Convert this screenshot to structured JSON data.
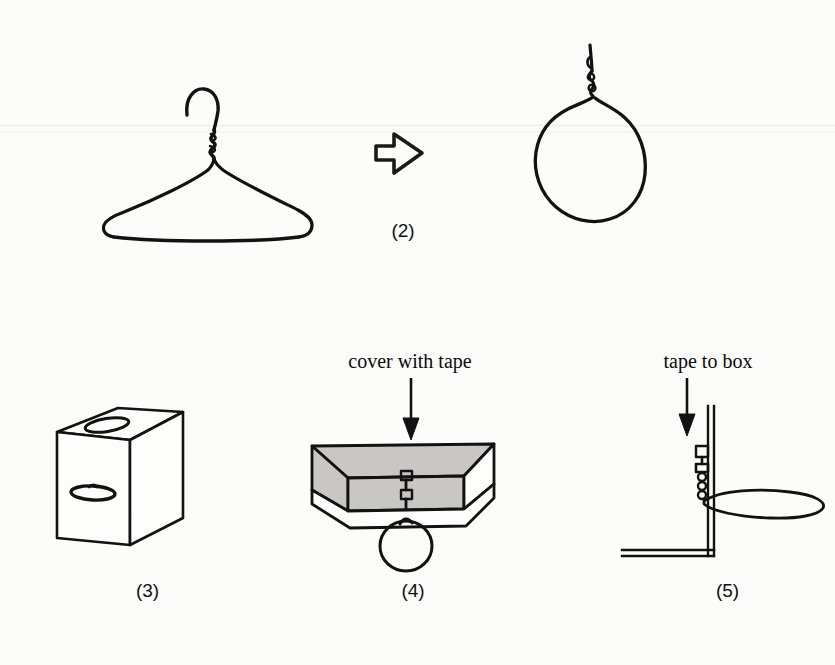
{
  "figure": {
    "background_color": "#fcfcfb",
    "ink_color": "#111111",
    "box_fill_color": "#c9c7c4",
    "type": "instructional-line-drawing"
  },
  "steps": [
    {
      "id": "step-1",
      "label": "",
      "subject": "wire-coat-hanger",
      "caption": ""
    },
    {
      "id": "step-2",
      "label": "(2)",
      "subject": "hanger-bent-into-loop",
      "caption": ""
    },
    {
      "id": "step-3",
      "label": "(3)",
      "subject": "cardboard-box-with-two-slots",
      "caption": ""
    },
    {
      "id": "step-4",
      "label": "(4)",
      "subject": "open-box-with-loop-hanging",
      "caption": "cover with tape"
    },
    {
      "id": "step-5",
      "label": "(5)",
      "subject": "cross-section-loop-taped-to-box-wall",
      "caption": "tape to box"
    }
  ],
  "icons": {
    "transform_arrow": "block-arrow-right-icon",
    "step4_arrow": "arrow-down-icon",
    "step5_arrow": "arrow-down-icon"
  },
  "labels": {
    "step2": "(2)",
    "step3": "(3)",
    "step4": "(4)",
    "step5": "(5)"
  },
  "captions": {
    "cover_with_tape": "cover with tape",
    "tape_to_box": "tape to box"
  }
}
